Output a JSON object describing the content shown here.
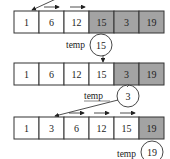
{
  "diagram": {
    "colors": {
      "sorted_fill": "#ffffff",
      "unsorted_fill": "#a3a3a3",
      "stroke": "#333333"
    },
    "rows": [
      {
        "cells": [
          {
            "value": "1",
            "shaded": false
          },
          {
            "value": "6",
            "shaded": false
          },
          {
            "value": "12",
            "shaded": false
          },
          {
            "value": "15",
            "shaded": true
          },
          {
            "value": "3",
            "shaded": true
          },
          {
            "value": "19",
            "shaded": true
          }
        ],
        "temp_label": "temp",
        "temp_value": "15"
      },
      {
        "cells": [
          {
            "value": "1",
            "shaded": false
          },
          {
            "value": "6",
            "shaded": false
          },
          {
            "value": "12",
            "shaded": false
          },
          {
            "value": "15",
            "shaded": false
          },
          {
            "value": "3",
            "shaded": true
          },
          {
            "value": "19",
            "shaded": true
          }
        ],
        "temp_label": "temp",
        "temp_value": "3"
      },
      {
        "cells": [
          {
            "value": "1",
            "shaded": false
          },
          {
            "value": "3",
            "shaded": false
          },
          {
            "value": "6",
            "shaded": false
          },
          {
            "value": "12",
            "shaded": false
          },
          {
            "value": "15",
            "shaded": false
          },
          {
            "value": "19",
            "shaded": true
          }
        ],
        "temp_label": "temp",
        "temp_value": "19"
      }
    ]
  }
}
